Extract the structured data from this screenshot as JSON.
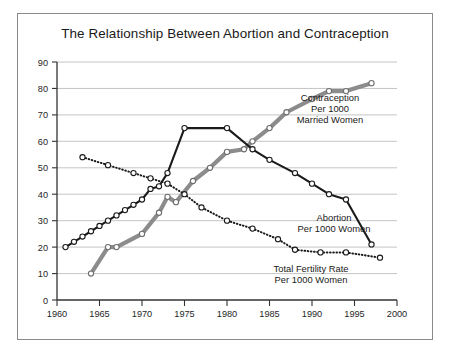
{
  "figure": {
    "title": "The Relationship Between Abortion and Contraception",
    "background_color": "#ffffff",
    "frame_color": "#8a8a8a"
  },
  "axes": {
    "x_ticks": [
      "1960",
      "1965",
      "1970",
      "1975",
      "1980",
      "1985",
      "1990",
      "1995",
      "2000"
    ],
    "y_ticks": [
      "0",
      "10",
      "20",
      "30",
      "40",
      "50",
      "60",
      "70",
      "80",
      "90"
    ]
  },
  "labels": {
    "contraception": {
      "line1": "Contraception",
      "line2": "Per 1000",
      "line3": "Married Women"
    },
    "abortion": {
      "line1": "Abortion",
      "line2": "Per 1000 Women"
    },
    "fertility": {
      "line1": "Total Fertility Rate",
      "line2": "Per 1000 Women"
    }
  },
  "chart_data": {
    "type": "line",
    "title": "The Relationship Between Abortion and Contraception",
    "xlabel": "",
    "ylabel": "",
    "xlim": [
      1960,
      2000
    ],
    "ylim": [
      0,
      90
    ],
    "xticks": [
      1960,
      1965,
      1970,
      1975,
      1980,
      1985,
      1990,
      1995,
      2000
    ],
    "yticks": [
      0,
      10,
      20,
      30,
      40,
      50,
      60,
      70,
      80,
      90
    ],
    "grid": "horizontal",
    "legend": "inline-annotations",
    "series": [
      {
        "name": "Abortion Per 1000 Women",
        "color": "#1a1a1a",
        "style": "solid",
        "marker": "open-circle",
        "x": [
          1961,
          1962,
          1963,
          1964,
          1965,
          1966,
          1967,
          1968,
          1969,
          1970,
          1971,
          1972,
          1973,
          1975,
          1980,
          1983,
          1985,
          1988,
          1990,
          1992,
          1994,
          1997
        ],
        "y": [
          20,
          22,
          24,
          26,
          28,
          30,
          32,
          34,
          36,
          38,
          42,
          43,
          48,
          65,
          65,
          57,
          53,
          48,
          44,
          40,
          38,
          21
        ]
      },
      {
        "name": "Contraception Per 1000 Married Women",
        "color": "#8c8c8c",
        "style": "solid-thick",
        "marker": "open-circle",
        "x": [
          1964,
          1966,
          1967,
          1970,
          1972,
          1973,
          1974,
          1976,
          1978,
          1980,
          1982,
          1983,
          1985,
          1987,
          1990,
          1992,
          1994,
          1997
        ],
        "y": [
          10,
          20,
          20,
          25,
          33,
          39,
          37,
          45,
          50,
          56,
          57,
          60,
          65,
          71,
          76,
          79,
          79,
          82
        ]
      },
      {
        "name": "Total Fertility Rate Per 1000 Women",
        "color": "#1a1a1a",
        "style": "dotted",
        "marker": "open-circle",
        "x": [
          1963,
          1966,
          1969,
          1971,
          1973,
          1975,
          1977,
          1980,
          1983,
          1986,
          1988,
          1991,
          1994,
          1998
        ],
        "y": [
          54,
          51,
          48,
          46,
          44,
          40,
          35,
          30,
          27,
          23,
          19,
          18,
          18,
          16
        ]
      }
    ]
  }
}
